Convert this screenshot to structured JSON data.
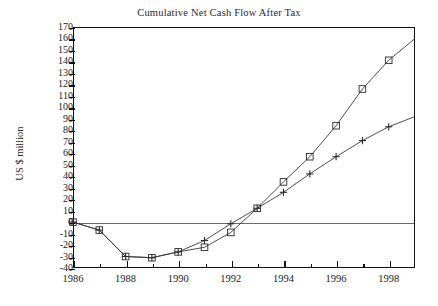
{
  "chart_data": {
    "type": "line",
    "title": "Cumulative Net Cash Flow After Tax",
    "xlabel": "",
    "ylabel": "US $ million",
    "grid": false,
    "legend_position": "none",
    "xlim": [
      1986,
      1999
    ],
    "ylim": [
      -40,
      170
    ],
    "ytick_step": 10,
    "x_major_labels": [
      "1986",
      "1988",
      "1990",
      "1992",
      "1994",
      "1996",
      "1998"
    ],
    "x_minor_ticks": [
      1987,
      1989,
      1991,
      1993,
      1995,
      1997
    ],
    "ytick_labels": [
      "170",
      "160",
      "150",
      "140",
      "130",
      "120",
      "110",
      "100",
      "90",
      "80",
      "70",
      "60",
      "50",
      "40",
      "30",
      "20",
      "10",
      "0",
      "-10",
      "-20",
      "-30",
      "-40"
    ],
    "x": [
      1986,
      1987,
      1988,
      1989,
      1990,
      1991,
      1992,
      1993,
      1994,
      1995,
      1996,
      1997,
      1998,
      1999
    ],
    "series": [
      {
        "name": "series-square",
        "marker": "square",
        "values": [
          0,
          -7,
          -30,
          -31,
          -26,
          -22,
          -9,
          12,
          35,
          57,
          84,
          116,
          141,
          160
        ],
        "last_point_is_edge": true
      },
      {
        "name": "series-plus",
        "marker": "plus",
        "values": [
          0,
          -7,
          -30,
          -31,
          -26,
          -16,
          -1.5,
          12,
          26,
          42,
          57,
          71,
          83,
          92
        ],
        "last_point_is_edge": true
      }
    ],
    "colors": {
      "line": "#3a3a3a",
      "marker_stroke": "#2b2b2b",
      "axis": "#111111",
      "zero_line": "#6a6a6a",
      "background": "#ffffff"
    }
  }
}
